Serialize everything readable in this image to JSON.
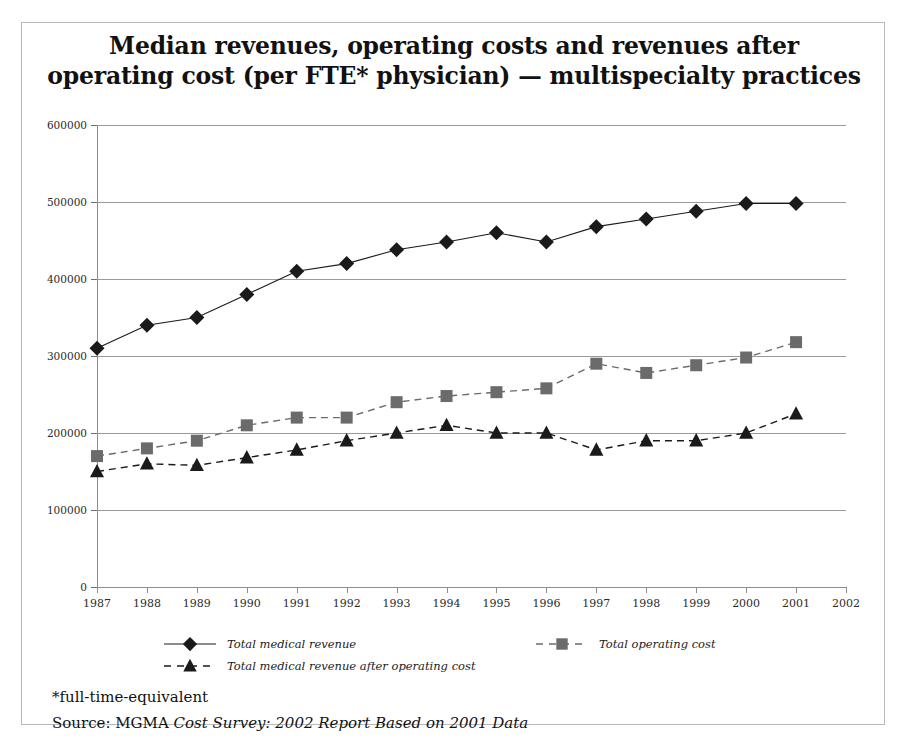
{
  "title": {
    "line1": "Median revenues, operating costs and revenues after",
    "line2": "operating cost (per FTE* physician) — multispecialty practices"
  },
  "notes": {
    "footnote": "*full-time-equivalent",
    "source_prefix": "Source: MGMA ",
    "source_italic": "Cost Survey: 2002 Report Based on 2001 Data"
  },
  "legend": {
    "items": [
      {
        "label": "Total medical revenue",
        "marker": "diamond",
        "line": "solid",
        "color": "#1a1a1a"
      },
      {
        "label": "Total operating cost",
        "marker": "square",
        "line": "dashed",
        "color": "#6b6b6b"
      },
      {
        "label": "Total medical revenue after operating cost",
        "marker": "triangle",
        "line": "dashed",
        "color": "#1a1a1a"
      }
    ]
  },
  "colors": {
    "total_medical_revenue": "#1a1a1a",
    "total_operating_cost": "#6b6b6b",
    "revenue_after_operating_cost": "#1a1a1a",
    "gridline": "#9a9a9a",
    "frame": "#b9b9b9"
  },
  "chart_data": {
    "type": "line",
    "title": "Median revenues, operating costs and revenues after operating cost (per FTE* physician) — multispecialty practices",
    "xlabel": "",
    "ylabel": "",
    "xlim": [
      1987,
      2002
    ],
    "ylim": [
      0,
      600000
    ],
    "ytick_labels": [
      "600000",
      "500000",
      "400000",
      "300000",
      "200000",
      "100000",
      "0"
    ],
    "yticks": [
      600000,
      500000,
      400000,
      300000,
      200000,
      100000,
      0
    ],
    "xticks": [
      1987,
      1988,
      1989,
      1990,
      1991,
      1992,
      1993,
      1994,
      1995,
      1996,
      1997,
      1998,
      1999,
      2000,
      2001,
      2002
    ],
    "grid": true,
    "legend_position": "bottom",
    "categories": [
      1987,
      1988,
      1989,
      1990,
      1991,
      1992,
      1993,
      1994,
      1995,
      1996,
      1997,
      1998,
      1999,
      2000,
      2001
    ],
    "series": [
      {
        "name": "Total medical revenue",
        "marker": "diamond",
        "linestyle": "solid",
        "color": "#1a1a1a",
        "values": [
          310000,
          340000,
          350000,
          380000,
          410000,
          420000,
          438000,
          448000,
          460000,
          448000,
          468000,
          478000,
          488000,
          498000,
          498000
        ]
      },
      {
        "name": "Total operating cost",
        "marker": "square",
        "linestyle": "dashed",
        "color": "#6b6b6b",
        "values": [
          170000,
          180000,
          190000,
          210000,
          220000,
          220000,
          240000,
          248000,
          253000,
          258000,
          290000,
          278000,
          288000,
          298000,
          318000
        ]
      },
      {
        "name": "Total medical revenue after operating cost",
        "marker": "triangle",
        "linestyle": "dashed",
        "color": "#1a1a1a",
        "values": [
          150000,
          160000,
          158000,
          168000,
          178000,
          190000,
          200000,
          210000,
          200000,
          200000,
          178000,
          190000,
          190000,
          200000,
          225000
        ]
      }
    ]
  }
}
